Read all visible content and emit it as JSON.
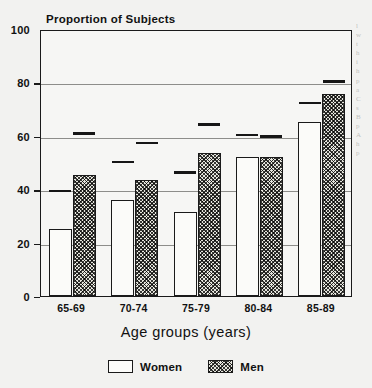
{
  "chart_data": {
    "type": "bar",
    "title": "Proportion of Subjects",
    "xlabel": "Age groups (years)",
    "ylabel": "",
    "categories": [
      "65-69",
      "70-74",
      "75-79",
      "80-84",
      "85-89"
    ],
    "series": [
      {
        "name": "Women",
        "values": [
          25,
          36,
          31.5,
          52,
          65
        ]
      },
      {
        "name": "Men",
        "values": [
          45.5,
          43.5,
          53.5,
          52,
          75.5
        ]
      }
    ],
    "markers": [
      {
        "name": "Women",
        "values": [
          40,
          51,
          47,
          61,
          73
        ]
      },
      {
        "name": "Men",
        "values": [
          61.5,
          58,
          65,
          60.5,
          81
        ]
      }
    ],
    "ylim": [
      0,
      100
    ],
    "yticks": [
      0,
      20,
      40,
      60,
      80,
      100
    ],
    "ytick_labels": [
      "0",
      "20",
      "40",
      "60",
      "80",
      "100"
    ],
    "grid": true,
    "legend_position": "bottom",
    "legend": [
      "Women",
      "Men"
    ]
  },
  "legend": {
    "items": [
      {
        "label": "Women",
        "style": "open"
      },
      {
        "label": "Men",
        "style": "hatched"
      }
    ]
  },
  "margin_text": {
    "lines": [
      "l",
      "w",
      "t",
      "h",
      "i",
      "h",
      "p",
      "a",
      "C",
      "s",
      "B",
      "p",
      "A",
      "h",
      "p"
    ]
  },
  "colors": {
    "ink": "#1a1a1a",
    "page": "#f2f2f0",
    "grid": "#8d8d8a",
    "bar_open": "#fbfbf9",
    "bar_hatch": "#3a3a38"
  }
}
